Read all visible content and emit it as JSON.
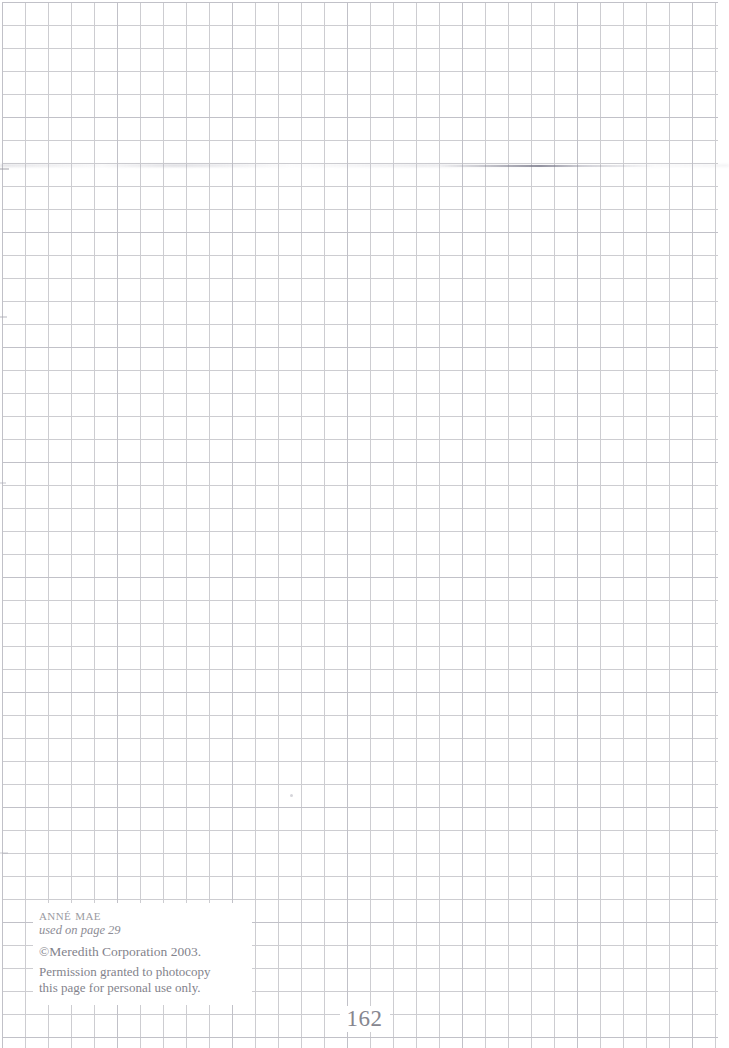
{
  "page": {
    "kind": "graph-paper-pattern-page",
    "width": 729,
    "height": 1048,
    "background_color": "#ffffff",
    "folio": "162"
  },
  "grid": {
    "cell_size_px": 23,
    "line_color": "#c9c9ce",
    "accent_line_color": "#b9b9c2",
    "origin_x": 2,
    "origin_y": 2,
    "width": 716,
    "height": 1046
  },
  "credit": {
    "pattern_name": "Anné Mae",
    "used_on": "used on page 29",
    "copyright": "©Meredith Corporation 2003.",
    "permission_line_1": "Permission granted to photocopy",
    "permission_line_2": "this page for personal use only.",
    "text_color": "#86868f",
    "panel_background": "#ffffff"
  },
  "artifacts": [
    {
      "name": "scan-smudge-horizontal",
      "x": 440,
      "y": 165,
      "width": 215,
      "height": 2
    },
    {
      "name": "scan-band-row",
      "x": 0,
      "y": 164,
      "width": 729,
      "height": 3
    },
    {
      "name": "edge-mark-upper",
      "x": 0,
      "y": 168,
      "width": 9,
      "height": 2
    },
    {
      "name": "edge-mark-mid",
      "x": 0,
      "y": 316,
      "width": 7,
      "height": 2
    },
    {
      "name": "edge-mark-lower",
      "x": 0,
      "y": 482,
      "width": 6,
      "height": 2
    },
    {
      "name": "edge-mark-bottom",
      "x": 0,
      "y": 852,
      "width": 8,
      "height": 2
    },
    {
      "name": "dust-speck",
      "x": 290,
      "y": 794,
      "width": 3,
      "height": 3
    }
  ]
}
